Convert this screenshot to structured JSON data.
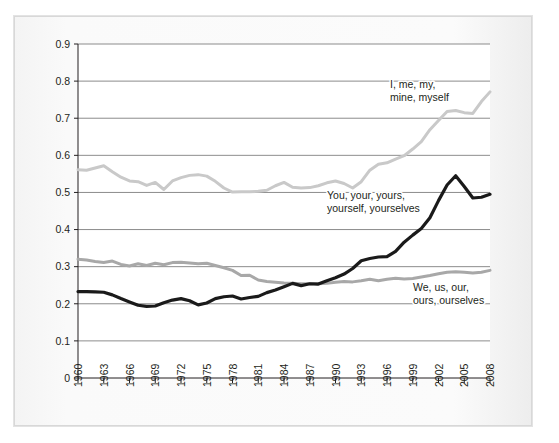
{
  "chart_data": {
    "type": "line",
    "title": "",
    "subtitle": "",
    "xlabel": "",
    "ylabel": "",
    "xlim": [
      1960,
      2008
    ],
    "ylim": [
      0,
      0.9
    ],
    "grid": true,
    "grid_axis": "y",
    "legend": "inline-annotations",
    "x_tick_labels": [
      "1960",
      "1963",
      "1966",
      "1969",
      "1972",
      "1975",
      "1978",
      "1981",
      "1984",
      "1987",
      "1990",
      "1993",
      "1996",
      "1999",
      "2002",
      "2005",
      "2008"
    ],
    "y_tick_labels": [
      "0",
      "0.1",
      "0.2",
      "0.3",
      "0.4",
      "0.5",
      "0.6",
      "0.7",
      "0.8",
      "0.9"
    ],
    "y_ticks": [
      0,
      0.1,
      0.2,
      0.3,
      0.4,
      0.5,
      0.6,
      0.7,
      0.8,
      0.9
    ],
    "x": [
      1960,
      1961,
      1962,
      1963,
      1964,
      1965,
      1966,
      1967,
      1968,
      1969,
      1970,
      1971,
      1972,
      1973,
      1974,
      1975,
      1976,
      1977,
      1978,
      1979,
      1980,
      1981,
      1982,
      1983,
      1984,
      1985,
      1986,
      1987,
      1988,
      1989,
      1990,
      1991,
      1992,
      1993,
      1994,
      1995,
      1996,
      1997,
      1998,
      1999,
      2000,
      2001,
      2002,
      2003,
      2004,
      2005,
      2006,
      2007,
      2008
    ],
    "series": [
      {
        "name": "I, me, my, mine, myself",
        "color": "#c9c9c9",
        "values": [
          0.561,
          0.56,
          0.566,
          0.572,
          0.556,
          0.541,
          0.531,
          0.529,
          0.519,
          0.527,
          0.508,
          0.531,
          0.54,
          0.546,
          0.548,
          0.544,
          0.53,
          0.512,
          0.501,
          0.502,
          0.502,
          0.503,
          0.506,
          0.518,
          0.527,
          0.514,
          0.512,
          0.513,
          0.518,
          0.526,
          0.531,
          0.524,
          0.512,
          0.529,
          0.56,
          0.576,
          0.58,
          0.59,
          0.599,
          0.617,
          0.637,
          0.669,
          0.694,
          0.718,
          0.721,
          0.715,
          0.713,
          0.745,
          0.771
        ]
      },
      {
        "name": "You, your, yours, yourself, yourselves",
        "color": "#1a1a1a",
        "values": [
          0.233,
          0.233,
          0.232,
          0.231,
          0.224,
          0.214,
          0.205,
          0.196,
          0.193,
          0.194,
          0.203,
          0.21,
          0.214,
          0.208,
          0.197,
          0.202,
          0.214,
          0.219,
          0.221,
          0.213,
          0.217,
          0.22,
          0.23,
          0.237,
          0.246,
          0.255,
          0.249,
          0.254,
          0.253,
          0.262,
          0.27,
          0.28,
          0.295,
          0.316,
          0.322,
          0.326,
          0.327,
          0.341,
          0.366,
          0.385,
          0.403,
          0.432,
          0.478,
          0.52,
          0.545,
          0.516,
          0.485,
          0.487,
          0.495
        ]
      },
      {
        "name": "We, us, our, ours, ourselves",
        "color": "#a8a8a8",
        "values": [
          0.32,
          0.318,
          0.314,
          0.311,
          0.315,
          0.306,
          0.302,
          0.308,
          0.303,
          0.309,
          0.305,
          0.311,
          0.312,
          0.31,
          0.308,
          0.309,
          0.303,
          0.297,
          0.29,
          0.276,
          0.277,
          0.264,
          0.26,
          0.258,
          0.256,
          0.255,
          0.254,
          0.254,
          0.254,
          0.255,
          0.258,
          0.26,
          0.259,
          0.262,
          0.266,
          0.262,
          0.266,
          0.269,
          0.267,
          0.268,
          0.272,
          0.276,
          0.281,
          0.285,
          0.286,
          0.285,
          0.283,
          0.285,
          0.29
        ]
      }
    ],
    "annotations": [
      {
        "id": "annotation-i-me-my",
        "line1": "I, me, my,",
        "line2": "mine, myself",
        "x": 390,
        "y": 88
      },
      {
        "id": "annotation-you-your",
        "line1": "You, your, yours,",
        "line2": "yourself, yourselves",
        "x": 327,
        "y": 199
      },
      {
        "id": "annotation-we-us-our",
        "line1": "We, us, our,",
        "line2": "ours, ourselves",
        "x": 413,
        "y": 291
      }
    ]
  }
}
